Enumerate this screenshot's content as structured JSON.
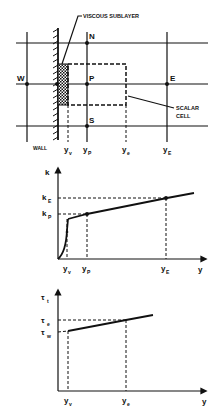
{
  "grid_diagram": {
    "labels": {
      "viscous_sublayer": "VISCOUS SUBLAYER",
      "north": "N",
      "west": "W",
      "point": "P",
      "east": "E",
      "south": "S",
      "scalar_cell_line1": "SCALAR",
      "scalar_cell_line2": "CELL",
      "wall": "WALL"
    },
    "axis_labels": [
      {
        "base": "y",
        "sub": "v"
      },
      {
        "base": "y",
        "sub": "P"
      },
      {
        "base": "y",
        "sub": "e"
      },
      {
        "base": "y",
        "sub": "E"
      }
    ]
  },
  "k_plot": {
    "y_axis_label": "k",
    "x_axis_label": "y",
    "y_ticks": [
      {
        "base": "k",
        "sub": "E"
      },
      {
        "base": "k",
        "sub": "P"
      }
    ],
    "x_ticks": [
      {
        "base": "y",
        "sub": "v"
      },
      {
        "base": "y",
        "sub": "P"
      },
      {
        "base": "y",
        "sub": "E"
      }
    ]
  },
  "tau_plot": {
    "y_axis_label": {
      "base": "τ",
      "sub": "t"
    },
    "x_axis_label": "y",
    "y_ticks": [
      {
        "base": "τ",
        "sub": "e"
      },
      {
        "base": "τ",
        "sub": "w"
      }
    ],
    "x_ticks": [
      {
        "base": "y",
        "sub": "v"
      },
      {
        "base": "y",
        "sub": "e"
      }
    ]
  }
}
